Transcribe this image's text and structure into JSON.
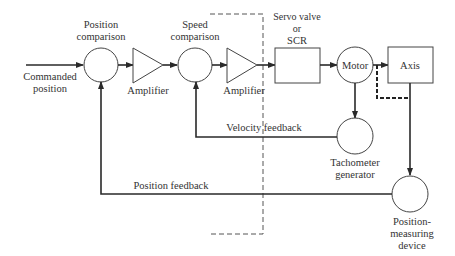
{
  "diagram": {
    "blocks": {
      "position_comparison": {
        "label_line1": "Position",
        "label_line2": "comparison"
      },
      "amplifier1": {
        "label": "Amplifier"
      },
      "speed_comparison": {
        "label_line1": "Speed",
        "label_line2": "comparison"
      },
      "amplifier2": {
        "label": "Amplifier"
      },
      "servo": {
        "label_line1": "Servo valve",
        "label_line2": "or",
        "label_line3": "SCR"
      },
      "motor": {
        "label": "Motor"
      },
      "axis": {
        "label": "Axis"
      },
      "tachometer": {
        "label_line1": "Tachometer",
        "label_line2": "generator"
      },
      "position_measuring": {
        "label_line1": "Position-",
        "label_line2": "measuring",
        "label_line3": "device"
      }
    },
    "input": {
      "label_line1": "Commanded",
      "label_line2": "position"
    },
    "feedback": {
      "velocity": "Velocity feedback",
      "position": "Position feedback"
    }
  }
}
